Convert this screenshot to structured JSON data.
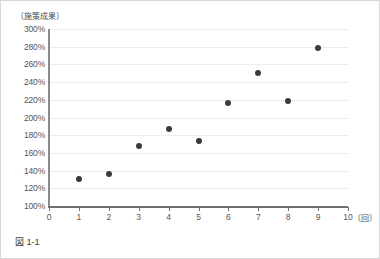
{
  "figure": {
    "caption": "図 1-1",
    "y_unit_label": "〔施策成果〕",
    "x_unit_label": "〔回〕"
  },
  "chart_data": {
    "type": "scatter",
    "title": "",
    "xlabel": "〔回〕",
    "ylabel": "〔施策成果〕",
    "xlim": [
      0,
      10
    ],
    "ylim": [
      100,
      300
    ],
    "grid": true,
    "legend": "none",
    "x_ticks": [
      0,
      1,
      2,
      3,
      4,
      5,
      6,
      7,
      8,
      9,
      10
    ],
    "x_tick_labels": [
      "0",
      "1",
      "2",
      "3",
      "4",
      "5",
      "6",
      "7",
      "8",
      "9",
      "10"
    ],
    "y_ticks": [
      100,
      120,
      140,
      160,
      180,
      200,
      220,
      240,
      260,
      280,
      300
    ],
    "y_tick_labels": [
      "100%",
      "120%",
      "140%",
      "160%",
      "180%",
      "200%",
      "220%",
      "240%",
      "260%",
      "280%",
      "300%"
    ],
    "series": [
      {
        "name": "施策成果",
        "marker": "circle",
        "color": "#3b3b3b",
        "x": [
          1,
          2,
          3,
          4,
          5,
          6,
          7,
          8,
          9
        ],
        "y": [
          130,
          136,
          168,
          187,
          174,
          216,
          250,
          219,
          278
        ]
      }
    ]
  }
}
